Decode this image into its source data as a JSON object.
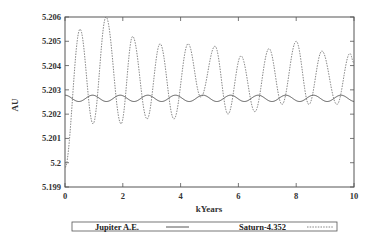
{
  "chart_data": {
    "type": "line",
    "title": "",
    "xlabel": "kYears",
    "ylabel": "AU",
    "xlim": [
      0,
      10
    ],
    "ylim": [
      5.199,
      5.206
    ],
    "x_ticks": [
      "0",
      "2",
      "4",
      "6",
      "8",
      "10"
    ],
    "y_ticks": [
      "5.199",
      "5.2",
      "5.201",
      "5.202",
      "5.203",
      "5.204",
      "5.205",
      "5.206"
    ],
    "grid": false,
    "legend_position": "bottom",
    "series": [
      {
        "name": "Jupiter A.E.",
        "style": "solid",
        "description": "small oscillation between ~5.2025 and ~5.2028 AU, period ~0.95 kyr",
        "mean": 5.20265,
        "amplitude": 0.00013,
        "period_kyr": 0.955,
        "phase_peak_kyr": 0.0
      },
      {
        "name": "Saturn-4.352",
        "style": "dashed",
        "description": "large oscillation, offset by -4.352 AU, period ~0.93 kyr",
        "x": [
          0.0,
          0.52,
          0.97,
          1.42,
          1.94,
          2.34,
          2.84,
          3.29,
          3.77,
          4.26,
          4.7,
          5.19,
          5.64,
          6.09,
          6.57,
          7.06,
          7.51,
          8.0,
          8.44,
          8.89,
          9.41,
          9.86,
          10.0
        ],
        "values": [
          5.1998,
          5.2055,
          5.2016,
          5.206,
          5.2016,
          5.2052,
          5.2018,
          5.2049,
          5.2018,
          5.2049,
          5.2027,
          5.2048,
          5.202,
          5.2044,
          5.2021,
          5.2047,
          5.2024,
          5.205,
          5.2024,
          5.2046,
          5.2024,
          5.2045,
          5.2041
        ]
      }
    ]
  },
  "axes": {
    "xlabel": "kYears",
    "ylabel": "AU"
  },
  "legend": {
    "items": [
      {
        "label": "Jupiter A.E.",
        "line": "solid"
      },
      {
        "label": "Saturn-4.352",
        "line": "dashed"
      }
    ]
  },
  "colors": {
    "frame": "#555555",
    "jupiter": "#444444",
    "saturn": "#666666",
    "text": "#222222"
  }
}
